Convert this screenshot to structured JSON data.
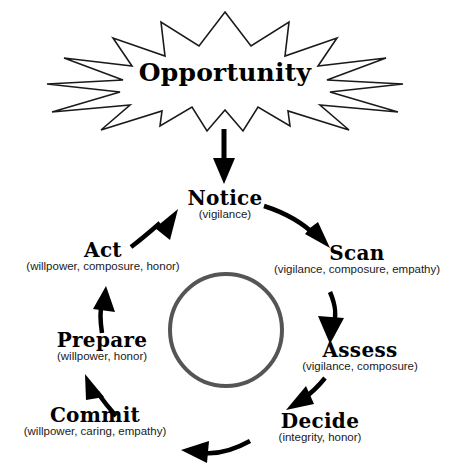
{
  "diagram": {
    "title_node": {
      "label": "Opportunity",
      "shape": "starburst"
    },
    "center": {
      "shape": "ring",
      "label": ""
    },
    "nodes": [
      {
        "id": "notice",
        "label": "Notice",
        "traits": "(vigilance)"
      },
      {
        "id": "scan",
        "label": "Scan",
        "traits": "(vigilance, composure, empathy)"
      },
      {
        "id": "assess",
        "label": "Assess",
        "traits": "(vigilance, composure)"
      },
      {
        "id": "decide",
        "label": "Decide",
        "traits": "(integrity,  honor)"
      },
      {
        "id": "commit",
        "label": "Commit",
        "traits": "(willpower, caring, empathy)"
      },
      {
        "id": "prepare",
        "label": "Prepare",
        "traits": "(willpower,  honor)"
      },
      {
        "id": "act",
        "label": "Act",
        "traits": "(willpower, composure, honor)"
      }
    ],
    "colors": {
      "ink": "#000000",
      "outline": "#1a1a1a",
      "ring": "#555555",
      "background": "#ffffff"
    }
  }
}
